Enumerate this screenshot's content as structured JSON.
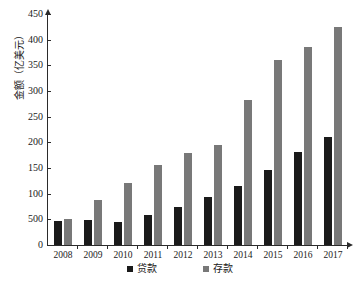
{
  "chart_data": {
    "type": "bar",
    "title": "",
    "xlabel": "",
    "ylabel": "金额（亿美元）",
    "categories": [
      "2008",
      "2009",
      "2010",
      "2011",
      "2012",
      "2013",
      "2014",
      "2015",
      "2016",
      "2017"
    ],
    "series": [
      {
        "name": "贷款",
        "color": "#1a1a1a",
        "values": [
          47,
          48,
          45,
          58,
          75,
          93,
          114,
          146,
          181,
          210
        ]
      },
      {
        "name": "存款",
        "color": "#787878",
        "values": [
          50,
          88,
          120,
          155,
          179,
          195,
          282,
          361,
          385,
          425
        ]
      }
    ],
    "ylim": [
      0,
      450
    ],
    "ytick_values": [
      0,
      50,
      100,
      150,
      200,
      250,
      300,
      350,
      400,
      450
    ],
    "ytick_labels": [
      "0",
      "500",
      "100",
      "150",
      "200",
      "250",
      "300",
      "350",
      "400",
      "450"
    ],
    "grid": false,
    "legend_position": "bottom"
  }
}
